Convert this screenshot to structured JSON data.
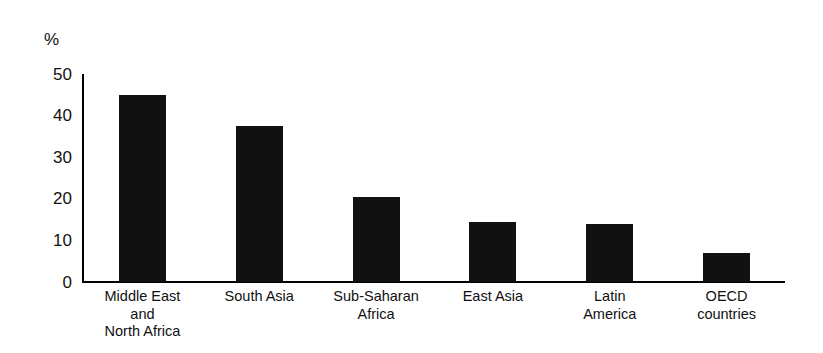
{
  "chart_data": {
    "type": "bar",
    "title": "",
    "xlabel": "",
    "ylabel": "%",
    "unit_label": "%",
    "categories": [
      "Middle East\nand\nNorth Africa",
      "South Asia",
      "Sub-Saharan\nAfrica",
      "East Asia",
      "Latin\nAmerica",
      "OECD\ncountries"
    ],
    "values": [
      45,
      37.5,
      20.5,
      14.5,
      14,
      7
    ],
    "ylim": [
      0,
      50
    ],
    "yticks": [
      0,
      10,
      20,
      30,
      40,
      50
    ],
    "ytick_labels": [
      "0",
      "10",
      "20",
      "30",
      "40",
      "50"
    ],
    "grid": false,
    "legend": false,
    "bar_color": "#111111",
    "axis_color": "#000000",
    "background_color": "#ffffff"
  }
}
